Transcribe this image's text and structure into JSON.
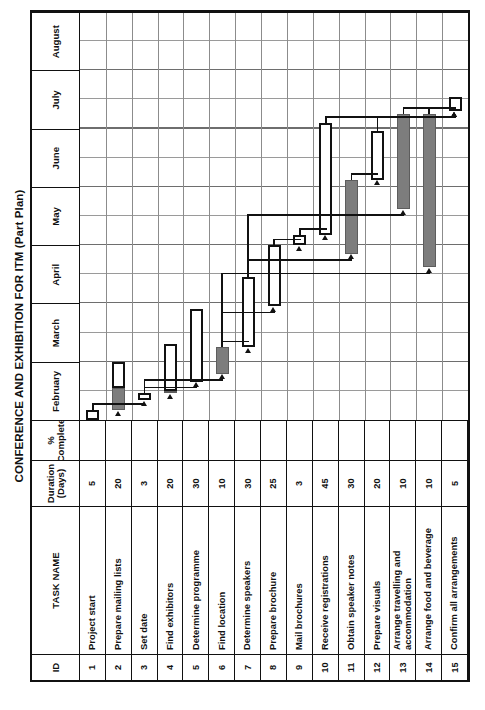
{
  "title": "CONFERENCE AND EXHIBITION FOR ITM (Part Plan)",
  "columns": {
    "id": "ID",
    "task_name": "TASK NAME",
    "duration": "Duration (Days)",
    "duration_line1": "Duration",
    "duration_line2": "(Days)",
    "percent_complete": "% Complete",
    "percent_line1": "%",
    "percent_line2": "Complete"
  },
  "months": [
    "February",
    "March",
    "April",
    "May",
    "June",
    "July",
    "August"
  ],
  "colors": {
    "bar_complete": "#7d7d7d",
    "bar_remaining": "#ffffff",
    "outline": "#111111",
    "grid": "#8c8c8c",
    "background": "#ffffff"
  },
  "chart_data": {
    "type": "bar",
    "title": "CONFERENCE AND EXHIBITION FOR ITM (Part Plan)",
    "xlabel": "",
    "ylabel": "TASK NAME",
    "categories": [
      "Project start",
      "Prepare mailing lists",
      "Set date",
      "Find exhibitors",
      "Determine programme",
      "Find location",
      "Determine speakers",
      "Prepare brochure",
      "Mail brochures",
      "Receive registrations",
      "Obtain speaker notes",
      "Prepare visuals",
      "Arrange travelling and accommodation",
      "Arrange food and beverage",
      "Confirm all arrangements"
    ],
    "values": [
      5,
      20,
      3,
      20,
      30,
      10,
      30,
      25,
      3,
      45,
      30,
      20,
      10,
      10,
      5
    ],
    "axis_months": [
      "February",
      "March",
      "April",
      "May",
      "June",
      "July",
      "August"
    ]
  },
  "tasks": [
    {
      "id": "1",
      "name": "Project start",
      "duration": "5",
      "percent": "",
      "start": 0.0,
      "end": 0.17,
      "done": 0.0
    },
    {
      "id": "2",
      "name": "Prepare mailing lists",
      "duration": "20",
      "percent": "",
      "start": 0.17,
      "end": 1.0,
      "done": 0.55
    },
    {
      "id": "3",
      "name": "Set date",
      "duration": "3",
      "percent": "",
      "start": 0.34,
      "end": 0.46,
      "done": 0.0
    },
    {
      "id": "4",
      "name": "Find exhibitors",
      "duration": "20",
      "percent": "",
      "start": 0.46,
      "end": 1.3,
      "done": 0.5
    },
    {
      "id": "5",
      "name": "Determine programme",
      "duration": "30",
      "percent": "",
      "start": 0.66,
      "end": 1.9,
      "done": 0.0
    },
    {
      "id": "6",
      "name": "Find location",
      "duration": "10",
      "percent": "",
      "start": 0.79,
      "end": 1.25,
      "done": 1.25
    },
    {
      "id": "7",
      "name": "Determine speakers",
      "duration": "30",
      "percent": "",
      "start": 1.25,
      "end": 2.45,
      "done": 0.0
    },
    {
      "id": "8",
      "name": "Prepare brochure",
      "duration": "25",
      "percent": "",
      "start": 1.95,
      "end": 3.0,
      "done": 0.0
    },
    {
      "id": "9",
      "name": "Mail brochures",
      "duration": "3",
      "percent": "",
      "start": 3.0,
      "end": 3.18,
      "done": 0.0
    },
    {
      "id": "10",
      "name": "Receive registrations",
      "duration": "45",
      "percent": "",
      "start": 3.18,
      "end": 5.1,
      "done": 0.0
    },
    {
      "id": "11",
      "name": "Obtain speaker notes",
      "duration": "30",
      "percent": "",
      "start": 2.85,
      "end": 4.12,
      "done": 4.12
    },
    {
      "id": "12",
      "name": "Prepare visuals",
      "duration": "20",
      "percent": "",
      "start": 4.12,
      "end": 4.95,
      "done": 0.0
    },
    {
      "id": "13",
      "name": "Arrange travelling and accommodation",
      "duration": "10",
      "percent": "",
      "start": 3.62,
      "end": 5.25,
      "done": 5.25
    },
    {
      "id": "14",
      "name": "Arrange food and beverage",
      "duration": "10",
      "percent": "",
      "start": 2.62,
      "end": 5.25,
      "done": 5.25
    },
    {
      "id": "15",
      "name": "Confirm all arrangements",
      "duration": "5",
      "percent": "",
      "start": 5.3,
      "end": 5.55,
      "done": 0.0
    }
  ]
}
